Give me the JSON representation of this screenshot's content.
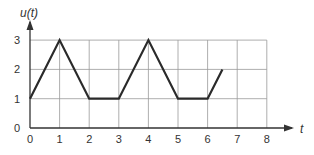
{
  "chart_data": {
    "type": "line",
    "title": "",
    "xlabel": "t",
    "ylabel": "u(t)",
    "x_ticks": [
      "0",
      "1",
      "2",
      "3",
      "4",
      "5",
      "6",
      "7",
      "8"
    ],
    "y_ticks": [
      "0",
      "1",
      "2",
      "3"
    ],
    "xlim": [
      0,
      8
    ],
    "ylim": [
      0,
      3
    ],
    "grid": true,
    "legend": null,
    "series": [
      {
        "name": "u(t)",
        "x": [
          0,
          1,
          2,
          3,
          4,
          5,
          6,
          6.5
        ],
        "y": [
          1,
          3,
          1,
          1,
          3,
          1,
          1,
          2
        ]
      }
    ],
    "colors": {
      "line": "#2a2a2a",
      "grid": "#999999",
      "axis": "#333333"
    }
  }
}
